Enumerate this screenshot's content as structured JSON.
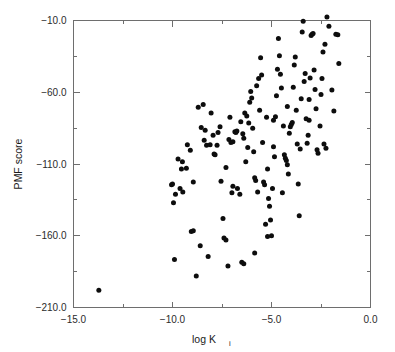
{
  "figure": {
    "background_color": "#ffffff",
    "frame_color": "#6e6e6e",
    "point_color": "#0d0d0d"
  },
  "axes": {
    "x_title_main": "log K",
    "x_title_subscript": "i",
    "y_title": "PMF score",
    "x_tick_labels": [
      "-15.0",
      "-10.0",
      "-5.0",
      "0.0"
    ],
    "y_tick_labels": [
      "-10.0",
      "-60.0",
      "-110.0",
      "-160.0",
      "-210.0"
    ]
  },
  "chart_data": {
    "type": "scatter",
    "title": "",
    "xlabel": "log Ki",
    "ylabel": "PMF score",
    "xlim": [
      -15.0,
      0.0
    ],
    "ylim": [
      -210.0,
      -10.0
    ],
    "x_ticks": [
      -15.0,
      -10.0,
      -5.0,
      0.0
    ],
    "y_ticks": [
      -10.0,
      -60.0,
      -110.0,
      -160.0,
      -210.0
    ],
    "x_minor_ticks": [
      -12.5,
      -7.5,
      -2.5
    ],
    "y_minor_ticks": [
      -35.0,
      -85.0,
      -135.0,
      -185.0
    ],
    "grid": false,
    "legend": false,
    "marker": "filled-circle",
    "marker_size_px": 5.0,
    "series": [
      {
        "name": "complexes",
        "points": [
          [
            -13.72,
            -198.0
          ],
          [
            -10.05,
            -124.5
          ],
          [
            -10.0,
            -124.0
          ],
          [
            -9.85,
            -131.0
          ],
          [
            -9.95,
            -137.0
          ],
          [
            -9.62,
            -127.0
          ],
          [
            -9.55,
            -113.5
          ],
          [
            -9.5,
            -108.5
          ],
          [
            -9.48,
            -129.5
          ],
          [
            -9.72,
            -106.5
          ],
          [
            -9.3,
            -113.0
          ],
          [
            -9.25,
            -96.5
          ],
          [
            -9.1,
            -100.5
          ],
          [
            -8.95,
            -122.5
          ],
          [
            -8.7,
            -70.5
          ],
          [
            -8.45,
            -68.5
          ],
          [
            -8.4,
            -93.5
          ],
          [
            -8.28,
            -97.0
          ],
          [
            -8.1,
            -96.5
          ],
          [
            -8.05,
            -74.5
          ],
          [
            -7.95,
            -90.0
          ],
          [
            -7.9,
            -103.0
          ],
          [
            -7.85,
            -103.5
          ],
          [
            -7.75,
            -97.0
          ],
          [
            -7.7,
            -88.0
          ],
          [
            -7.55,
            -122.0
          ],
          [
            -7.45,
            -148.0
          ],
          [
            -7.3,
            -112.5
          ],
          [
            -7.15,
            -93.0
          ],
          [
            -7.05,
            -95.0
          ],
          [
            -7.0,
            -130.0
          ],
          [
            -6.95,
            -94.5
          ],
          [
            -6.85,
            -87.5
          ],
          [
            -6.8,
            -88.0
          ],
          [
            -6.75,
            -87.0
          ],
          [
            -6.72,
            -127.0
          ],
          [
            -6.6,
            -131.0
          ],
          [
            -6.55,
            -80.5
          ],
          [
            -6.45,
            -89.0
          ],
          [
            -6.4,
            -92.0
          ],
          [
            -6.35,
            -74.5
          ],
          [
            -6.25,
            -76.5
          ],
          [
            -6.2,
            -98.5
          ],
          [
            -6.1,
            -67.0
          ],
          [
            -6.05,
            -59.5
          ],
          [
            -6.0,
            -64.0
          ],
          [
            -5.95,
            -85.0
          ],
          [
            -5.9,
            -101.5
          ],
          [
            -5.85,
            -119.5
          ],
          [
            -5.8,
            -121.5
          ],
          [
            -5.75,
            -55.5
          ],
          [
            -5.65,
            -50.5
          ],
          [
            -5.55,
            -36.0
          ],
          [
            -5.5,
            -48.0
          ],
          [
            -5.45,
            -95.0
          ],
          [
            -5.4,
            -122.5
          ],
          [
            -5.35,
            -124.5
          ],
          [
            -5.25,
            -77.5
          ],
          [
            -5.2,
            -113.5
          ],
          [
            -5.15,
            -134.0
          ],
          [
            -5.1,
            -139.5
          ],
          [
            -5.05,
            -149.0
          ],
          [
            -5.0,
            -160.0
          ],
          [
            -4.95,
            -127.0
          ],
          [
            -4.9,
            -98.0
          ],
          [
            -4.85,
            -105.0
          ],
          [
            -4.8,
            -77.0
          ],
          [
            -4.75,
            -62.5
          ],
          [
            -4.7,
            -44.0
          ],
          [
            -4.65,
            -22.5
          ],
          [
            -4.6,
            -34.5
          ],
          [
            -4.55,
            -47.5
          ],
          [
            -4.5,
            -57.0
          ],
          [
            -4.4,
            -83.5
          ],
          [
            -4.35,
            -103.5
          ],
          [
            -4.3,
            -106.0
          ],
          [
            -4.25,
            -107.5
          ],
          [
            -4.2,
            -110.5
          ],
          [
            -4.15,
            -117.0
          ],
          [
            -4.1,
            -88.5
          ],
          [
            -4.05,
            -84.0
          ],
          [
            -4.0,
            -82.5
          ],
          [
            -3.95,
            -81.0
          ],
          [
            -3.9,
            -56.5
          ],
          [
            -3.85,
            -41.0
          ],
          [
            -3.8,
            -35.5
          ],
          [
            -3.75,
            -72.5
          ],
          [
            -3.7,
            -96.0
          ],
          [
            -3.65,
            -124.0
          ],
          [
            -3.6,
            -146.0
          ],
          [
            -3.5,
            -64.5
          ],
          [
            -3.45,
            -18.0
          ],
          [
            -3.4,
            -10.5
          ],
          [
            -3.35,
            -52.5
          ],
          [
            -3.3,
            -47.0
          ],
          [
            -3.25,
            -78.5
          ],
          [
            -3.2,
            -95.5
          ],
          [
            -3.15,
            -90.0
          ],
          [
            -3.1,
            -65.0
          ],
          [
            -3.05,
            -50.0
          ],
          [
            -3.0,
            -20.5
          ],
          [
            -2.95,
            -19.5
          ],
          [
            -2.9,
            -19.0
          ],
          [
            -2.85,
            -44.5
          ],
          [
            -2.8,
            -58.0
          ],
          [
            -2.75,
            -71.5
          ],
          [
            -2.7,
            -100.0
          ],
          [
            -2.65,
            -102.5
          ],
          [
            -2.55,
            -83.5
          ],
          [
            -2.5,
            -61.5
          ],
          [
            -2.45,
            -50.5
          ],
          [
            -2.4,
            -32.0
          ],
          [
            -2.3,
            -26.5
          ],
          [
            -2.2,
            -7.5
          ],
          [
            -2.1,
            -14.0
          ],
          [
            -1.95,
            -58.5
          ],
          [
            -1.85,
            -73.0
          ],
          [
            -1.75,
            -19.5
          ],
          [
            -1.65,
            -20.0
          ],
          [
            -1.6,
            -40.0
          ],
          [
            -9.05,
            -157.0
          ],
          [
            -8.95,
            -156.5
          ],
          [
            -8.6,
            -167.0
          ],
          [
            -8.2,
            -174.5
          ],
          [
            -8.8,
            -188.0
          ],
          [
            -9.9,
            -176.5
          ],
          [
            -7.4,
            -161.5
          ],
          [
            -7.3,
            -163.0
          ],
          [
            -7.2,
            -181.0
          ],
          [
            -6.5,
            -178.5
          ],
          [
            -6.4,
            -179.5
          ],
          [
            -5.85,
            -172.0
          ],
          [
            -5.2,
            -160.5
          ],
          [
            -5.3,
            -152.0
          ],
          [
            -6.95,
            -125.5
          ],
          [
            -8.55,
            -84.5
          ],
          [
            -8.35,
            -86.5
          ],
          [
            -7.6,
            -84.0
          ],
          [
            -6.3,
            -108.5
          ],
          [
            -5.7,
            -129.5
          ],
          [
            -4.45,
            -130.0
          ],
          [
            -3.55,
            -99.5
          ],
          [
            -2.35,
            -96.0
          ],
          [
            -2.25,
            -99.0
          ],
          [
            -4.9,
            -79.5
          ],
          [
            -6.15,
            -81.5
          ],
          [
            -7.1,
            -77.5
          ],
          [
            -5.6,
            -72.5
          ],
          [
            -4.2,
            -70.0
          ],
          [
            -3.1,
            -79.5
          ]
        ]
      }
    ]
  }
}
